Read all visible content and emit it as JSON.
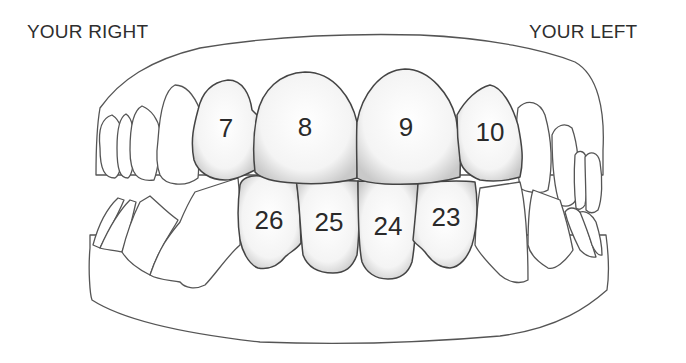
{
  "labels": {
    "right": "YOUR RIGHT",
    "left": "YOUR LEFT"
  },
  "numbering_system": "Universal",
  "colors": {
    "line": "#555555",
    "tooth_fill": "#f2f2f2",
    "tooth_shade": "#c8c8c8",
    "text": "#2a2a2a",
    "background": "#ffffff"
  },
  "upper_teeth": [
    {
      "number": "7",
      "name": "upper right lateral incisor"
    },
    {
      "number": "8",
      "name": "upper right central incisor"
    },
    {
      "number": "9",
      "name": "upper left central incisor"
    },
    {
      "number": "10",
      "name": "upper left lateral incisor"
    }
  ],
  "lower_teeth": [
    {
      "number": "26",
      "name": "lower right lateral incisor"
    },
    {
      "number": "25",
      "name": "lower right central incisor"
    },
    {
      "number": "24",
      "name": "lower left central incisor"
    },
    {
      "number": "23",
      "name": "lower left lateral incisor"
    }
  ]
}
